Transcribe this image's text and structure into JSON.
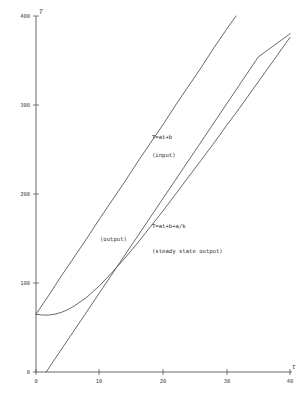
{
  "chart_data": {
    "type": "line",
    "title": "",
    "xlabel": "t",
    "ylabel": "T",
    "xlim": [
      0,
      40
    ],
    "ylim": [
      0,
      400
    ],
    "grid": false,
    "legend_position": "inline-annotations",
    "xticks": [
      0,
      10,
      20,
      30,
      40
    ],
    "xticklabels": [
      "0",
      "10",
      "20",
      "30",
      "40"
    ],
    "yticks": [
      0,
      100,
      200,
      300,
      400
    ],
    "yticklabels": [
      "0",
      "100",
      "200",
      "300",
      "400"
    ],
    "series": [
      {
        "name": "T=at+b",
        "role": "input",
        "type": "line",
        "annotation_equation": "T=at+b",
        "annotation_role": "(input)",
        "x": [
          0,
          2,
          4,
          6,
          8,
          10,
          12,
          14,
          16,
          18,
          20,
          22,
          24,
          26,
          28,
          30,
          31.5
        ],
        "y": [
          65,
          86,
          108,
          129,
          150,
          172,
          193,
          214,
          236,
          257,
          278,
          300,
          321,
          342,
          364,
          385,
          400
        ]
      },
      {
        "name": "output",
        "role": "output",
        "type": "curve",
        "annotation_role": "(output)",
        "x": [
          0,
          1,
          2,
          3,
          4,
          5,
          6,
          8,
          10,
          12,
          14,
          16,
          18,
          20,
          22,
          24,
          26,
          28,
          30,
          32,
          34,
          36,
          38,
          40
        ],
        "y": [
          65,
          64,
          64,
          65,
          67,
          70,
          74,
          84,
          97,
          112,
          128,
          145,
          163,
          181,
          200,
          219,
          238,
          257,
          277,
          296,
          316,
          336,
          356,
          376
        ]
      },
      {
        "name": "T=at+b+a/k",
        "role": "steady state output",
        "type": "line",
        "annotation_equation": "T=at+b+a/k",
        "annotation_role": "(steady state output)",
        "x": [
          1.6,
          5,
          10,
          15,
          20,
          25,
          30,
          35,
          40
        ],
        "y": [
          0,
          36,
          89,
          142,
          195,
          248,
          301,
          354,
          380
        ]
      }
    ],
    "annotations": [
      {
        "text": "T=at+b",
        "x_px": 152,
        "y_px": 139
      },
      {
        "text": "(input)",
        "x_px": 152,
        "y_px": 157
      },
      {
        "text": "(output)",
        "x_px": 100,
        "y_px": 241
      },
      {
        "text": "T=at+b+a/k",
        "x_px": 152,
        "y_px": 228
      },
      {
        "text": "(steady state output)",
        "x_px": 152,
        "y_px": 253
      }
    ]
  },
  "axes": {
    "y_axis_label": "T",
    "x_axis_label": "t",
    "origin_label": "0",
    "y_tick_400": "400",
    "y_tick_300": "300",
    "y_tick_200": "200",
    "y_tick_100": "100",
    "x_tick_0": "0",
    "x_tick_10": "10",
    "x_tick_20": "20",
    "x_tick_30": "30",
    "x_tick_40": "40"
  },
  "labels": {
    "input_equation": "T=at+b",
    "input_role": "(input)",
    "output_role": "(output)",
    "steady_equation": "T=at+b+a/k",
    "steady_role": "(steady state output)"
  },
  "colors": {
    "background": "#ffffff",
    "axis": "#555a5e",
    "curve": "#4a4f54",
    "text": "#2c3034"
  }
}
